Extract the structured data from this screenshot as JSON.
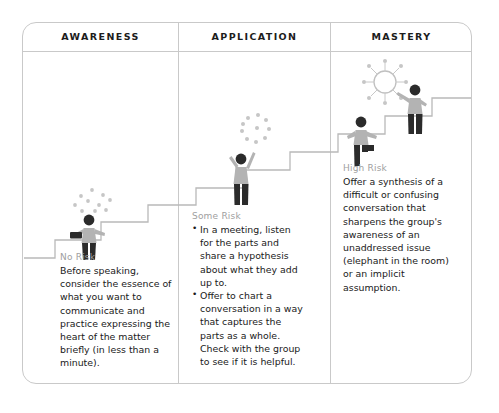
{
  "diagram": {
    "title_row": {
      "columns": [
        {
          "label": "AWARENESS"
        },
        {
          "label": "APPLICATION"
        },
        {
          "label": "MASTERY"
        }
      ]
    },
    "stages": [
      {
        "column": "AWARENESS",
        "risk_label": "No Risk",
        "body": "Before speaking, consider the essence of what you want to communicate and practice expressing the heart of the matter briefly (in less than a minute).",
        "bullets": []
      },
      {
        "column": "APPLICATION",
        "risk_label": "Some Risk",
        "body": "",
        "bullets": [
          "In a meeting, listen for the parts and share a hypothesis about what they add up to.",
          "Offer to chart a conversation in a way that captures the parts as a whole. Check with the group to see if it is helpful."
        ]
      },
      {
        "column": "MASTERY",
        "risk_label": "High Risk",
        "body": "Offer a synthesis of a difficult or confusing conversation that sharpens the group's awareness of an unaddressed issue (elephant in the room) or an implicit assumption.",
        "bullets": []
      }
    ],
    "illustration": {
      "figures": [
        {
          "name": "figure-holding-tray",
          "stage": "AWARENESS"
        },
        {
          "name": "figure-arms-raised",
          "stage": "APPLICATION"
        },
        {
          "name": "figure-climbing-step",
          "stage": "MASTERY"
        },
        {
          "name": "figure-reaching-up",
          "stage": "MASTERY"
        }
      ],
      "motifs": [
        {
          "name": "scattered-dots",
          "stage": "AWARENESS"
        },
        {
          "name": "dot-ring",
          "stage": "APPLICATION"
        },
        {
          "name": "radiant-sun",
          "stage": "MASTERY"
        }
      ],
      "staircase": {
        "name": "ascending-staircase",
        "steps": 7
      }
    },
    "colors": {
      "frame_border": "#c9c9c9",
      "header_text": "#1c1c1c",
      "risk_label": "#a0a0a0",
      "body_text": "#1a1a1a",
      "figure_shirt": "#b3b3b3",
      "figure_dark": "#2b2b2b",
      "stair_line": "#b9b9b9",
      "dot": "#c4c4c4"
    }
  }
}
